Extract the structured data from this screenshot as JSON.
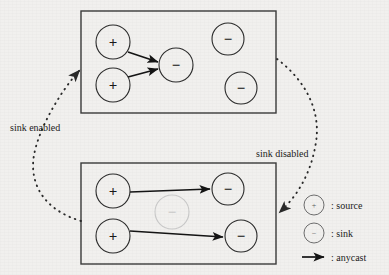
{
  "figure": {
    "background_color": "#f1f0ee",
    "stroke_color": "#2b2b2b",
    "disabled_color": "#c9c9c9"
  },
  "panels": [
    {
      "id": "top-panel",
      "name": "sink-enabled-panel",
      "box": {
        "x": 81,
        "y": 11,
        "width": 195,
        "height": 102
      },
      "nodes": [
        {
          "id": "t-src-1",
          "type": "source",
          "glyph": "+",
          "cx": 113,
          "cy": 42,
          "r": 17,
          "state": "active"
        },
        {
          "id": "t-src-2",
          "type": "source",
          "glyph": "+",
          "cx": 113,
          "cy": 85,
          "r": 17,
          "state": "active"
        },
        {
          "id": "t-sink-1",
          "type": "sink",
          "glyph": "−",
          "cx": 176,
          "cy": 65,
          "r": 17,
          "state": "active"
        },
        {
          "id": "t-sink-2",
          "type": "sink",
          "glyph": "−",
          "cx": 228,
          "cy": 39,
          "r": 16,
          "state": "active"
        },
        {
          "id": "t-sink-3",
          "type": "sink",
          "glyph": "−",
          "cx": 241,
          "cy": 88,
          "r": 16,
          "state": "active"
        }
      ],
      "anycast_edges": [
        {
          "from": "t-src-1",
          "to": "t-sink-1"
        },
        {
          "from": "t-src-2",
          "to": "t-sink-1"
        }
      ]
    },
    {
      "id": "bottom-panel",
      "name": "sink-disabled-panel",
      "box": {
        "x": 81,
        "y": 163,
        "width": 195,
        "height": 101
      },
      "nodes": [
        {
          "id": "b-src-1",
          "type": "source",
          "glyph": "+",
          "cx": 113,
          "cy": 191,
          "r": 17,
          "state": "active"
        },
        {
          "id": "b-src-2",
          "type": "source",
          "glyph": "+",
          "cx": 113,
          "cy": 236,
          "r": 17,
          "state": "active"
        },
        {
          "id": "b-sink-disabled",
          "type": "sink",
          "glyph": "−",
          "cx": 172,
          "cy": 212,
          "r": 17,
          "state": "disabled"
        },
        {
          "id": "b-sink-1",
          "type": "sink",
          "glyph": "−",
          "cx": 228,
          "cy": 189,
          "r": 16,
          "state": "active"
        },
        {
          "id": "b-sink-2",
          "type": "sink",
          "glyph": "−",
          "cx": 241,
          "cy": 236,
          "r": 16,
          "state": "active"
        }
      ],
      "anycast_edges": [
        {
          "from": "b-src-1",
          "to": "b-sink-1"
        },
        {
          "from": "b-src-2",
          "to": "b-sink-2"
        }
      ]
    }
  ],
  "transitions": [
    {
      "id": "sink-enabled-transition",
      "label": "sink enabled",
      "label_x": 10,
      "label_y": 130,
      "direction": "bottom-to-top",
      "path": "M 81 221 C 44 210, 29 184, 34 155 C 39 128, 60 92, 81 70",
      "arrow_at": "top"
    },
    {
      "id": "sink-disabled-transition",
      "label": "sink disabled",
      "label_x": 256,
      "label_y": 156,
      "direction": "top-to-bottom",
      "path": "M 277 59 C 305 80, 320 110, 316 142 C 312 174, 296 198, 278 214",
      "arrow_at": "bottom"
    }
  ],
  "legend": {
    "name": "legend",
    "items": [
      {
        "id": "legend-source",
        "symbol": "circle",
        "glyph": "+",
        "cx": 314,
        "cy": 205,
        "r": 10,
        "label": ": source",
        "label_x": 331,
        "label_y": 209
      },
      {
        "id": "legend-sink",
        "symbol": "circle",
        "glyph": "−",
        "cx": 314,
        "cy": 233,
        "r": 10,
        "label": ": sink",
        "label_x": 331,
        "label_y": 237
      },
      {
        "id": "legend-anycast",
        "symbol": "arrow",
        "x1": 302,
        "y1": 257,
        "x2": 326,
        "y2": 257,
        "label": ": anycast",
        "label_x": 331,
        "label_y": 261
      }
    ]
  }
}
